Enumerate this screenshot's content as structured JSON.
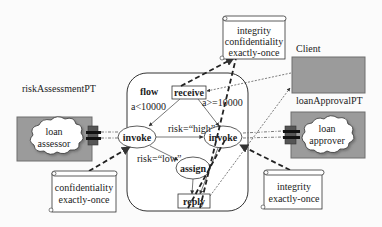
{
  "diagram": {
    "colors": {
      "background": "#fbfbfb",
      "partner_box_fill": "#9b9b9b",
      "partner_box_stroke": "#6e6e6e",
      "cloud_fill": "#ffffff",
      "port_fill": "#555555",
      "line": "#333333"
    },
    "partners": {
      "client": {
        "label": "Client"
      },
      "risk_assessment": {
        "label": "riskAssessmentPT",
        "service": [
          "loan",
          "assessor"
        ]
      },
      "loan_approval": {
        "label": "loanApprovalPT",
        "service": [
          "loan",
          "approver"
        ]
      }
    },
    "flow": {
      "label": "flow",
      "activities": {
        "receive": "receive",
        "invoke_left": "invoke",
        "invoke_right": "invoke",
        "assign": "assign",
        "reply": "reply"
      },
      "conditions": {
        "receive_to_left": "a<10000",
        "receive_to_right": "a>=10000",
        "risk_high": "risk=“high”",
        "risk_low": "risk=“low”"
      }
    },
    "policies": {
      "top": [
        "integrity",
        "confidentiality",
        "exactly-once"
      ],
      "bottom_left": [
        "confidentiality",
        "exactly-once"
      ],
      "bottom_right": [
        "integrity",
        "exactly-once"
      ]
    }
  }
}
